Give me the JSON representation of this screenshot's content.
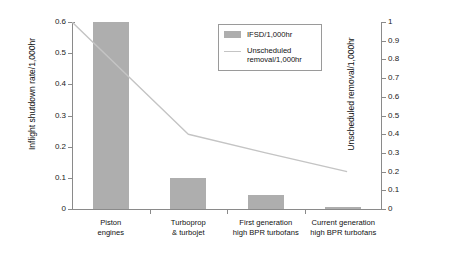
{
  "chart_data": {
    "type": "bar",
    "title": "",
    "subtitle": "",
    "categories": [
      "Piston\nengines",
      "Turboprop\n& turbojet",
      "First generation\nhigh BPR turbofans",
      "Current generation\nhigh BPR turbofans"
    ],
    "categories_lines": [
      [
        "Piston",
        "engines"
      ],
      [
        "Turboprop",
        "& turbojet"
      ],
      [
        "First generation",
        "high BPR turbofans"
      ],
      [
        "Current generation",
        "high BPR turbofans"
      ]
    ],
    "series": [
      {
        "name": "IFSD/1,000hr",
        "type": "bar",
        "axis": "left",
        "color": "#aeaeae",
        "values": [
          0.6,
          0.1,
          0.045,
          0.005
        ]
      },
      {
        "name": "Unscheduled removal/1,000hr",
        "type": "line",
        "axis": "right",
        "color": "#c4c4c4",
        "values": [
          1.0,
          0.4,
          0.3,
          0.2
        ]
      }
    ],
    "xlabel": "",
    "ylabel": "Inflight shutdown rate/1,000hr",
    "ylabel_right": "Unscheduled removal/1,000hr",
    "ylim": [
      0,
      0.6
    ],
    "ylim_right": [
      0,
      1
    ],
    "yticks": [
      "0",
      "0.1",
      "0.2",
      "0.3",
      "0.4",
      "0.5",
      "0.6"
    ],
    "ytick_values": [
      0,
      0.1,
      0.2,
      0.3,
      0.4,
      0.5,
      0.6
    ],
    "yticks_right": [
      "0",
      "0.1",
      "0.2",
      "0.3",
      "0.4",
      "0.5",
      "0.6",
      "0.7",
      "0.8",
      "0.9",
      "1"
    ],
    "ytick_values_right": [
      0,
      0.1,
      0.2,
      0.3,
      0.4,
      0.5,
      0.6,
      0.7,
      0.8,
      0.9,
      1
    ],
    "grid": false,
    "legend_position": "top-right"
  },
  "legend": {
    "items": [
      {
        "label": "IFSD/1,000hr",
        "marker": "bar-swatch"
      },
      {
        "label": "Unscheduled removal/1,000hr",
        "marker": "line-swatch",
        "line1": "Unscheduled",
        "line2": "removal/1,000hr"
      }
    ]
  },
  "colors": {
    "bar": "#aeaeae",
    "line": "#c4c4c4",
    "axis": "#8a8a8a",
    "text": "#111111",
    "background": "#ffffff"
  }
}
